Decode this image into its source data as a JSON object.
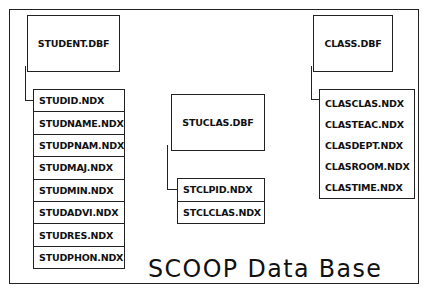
{
  "diagram": {
    "title": "SCOOP Data Base",
    "tables": [
      {
        "name": "STUDENT.DBF",
        "indexes": [
          "STUDID.NDX",
          "STUDNAME.NDX",
          "STUDPNAM.NDX",
          "STUDMAJ.NDX",
          "STUDMIN.NDX",
          "STUDADVI.NDX",
          "STUDRES.NDX",
          "STUDPHON.NDX"
        ]
      },
      {
        "name": "STUCLAS.DBF",
        "indexes": [
          "STCLPID.NDX",
          "STCLCLAS.NDX"
        ]
      },
      {
        "name": "CLASS.DBF",
        "indexes": [
          "CLASCLAS.NDX",
          "CLASTEAC.NDX",
          "CLASDEPT.NDX",
          "CLASROOM.NDX",
          "CLASTIME.NDX"
        ]
      }
    ]
  },
  "colors": {
    "line": "#222222",
    "background": "#ffffff",
    "text": "#111111"
  }
}
